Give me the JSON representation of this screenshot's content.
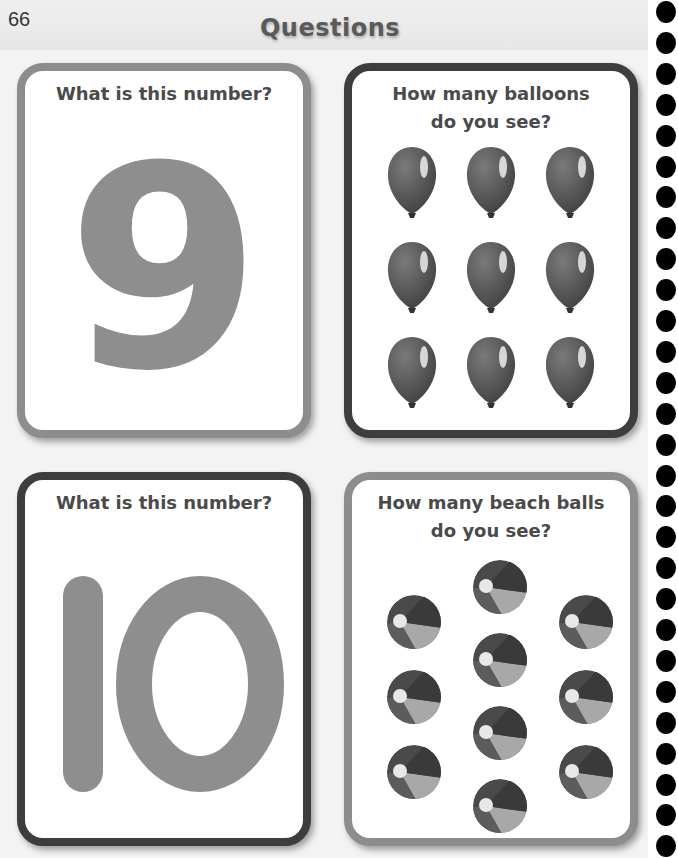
{
  "page": {
    "number": "66",
    "title": "Questions"
  },
  "cards": [
    {
      "id": "number-nine",
      "title": "What is this number?",
      "number": "9",
      "border": "#8d8d8d"
    },
    {
      "id": "balloons",
      "title_line1": "How many balloons",
      "title_line2": "do you see?",
      "item_icon": "balloon-icon",
      "item_count": 9,
      "border": "#3d3d3d"
    },
    {
      "id": "number-ten",
      "title": "What is this number?",
      "number": "10",
      "border": "#3d3d3d"
    },
    {
      "id": "beach-balls",
      "title_line1": "How many beach balls",
      "title_line2": "do you see?",
      "item_icon": "beach-ball-icon",
      "item_count": 10,
      "border": "#8d8d8d"
    }
  ],
  "spiral": {
    "dot_count": 28,
    "dot_color": "#000000"
  }
}
